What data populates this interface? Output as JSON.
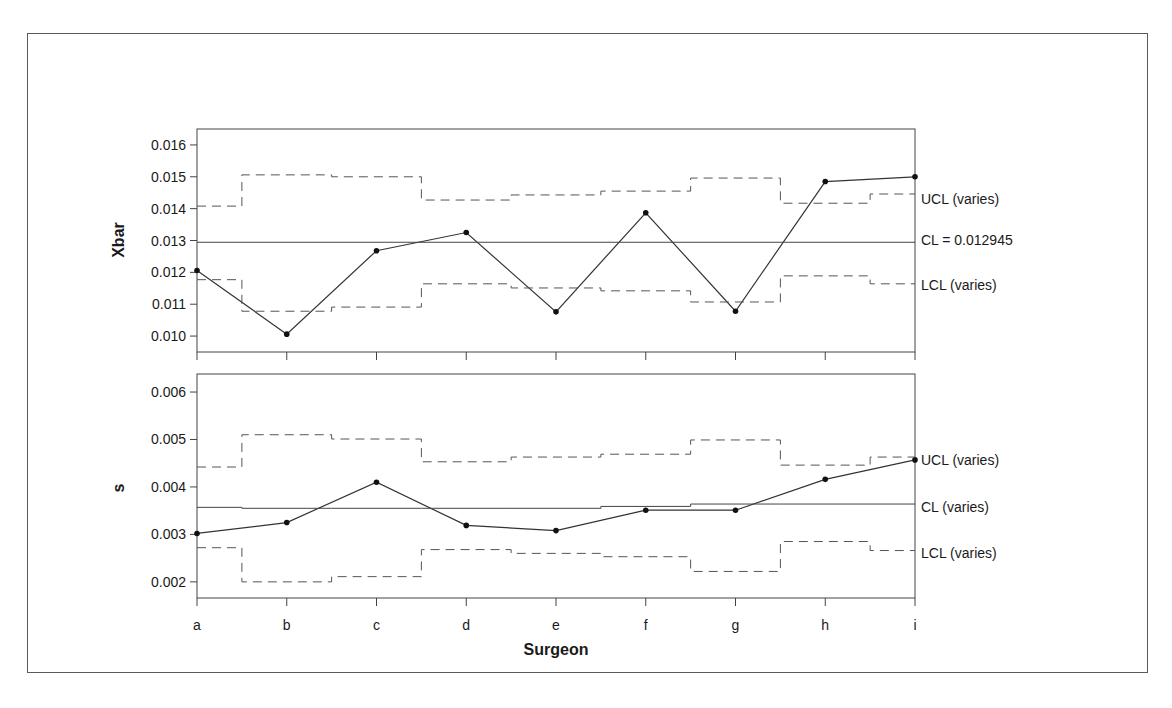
{
  "chart_data": [
    {
      "type": "line",
      "subtype": "xbar-control-chart",
      "panel": "top",
      "ylabel": "Xbar",
      "xlabel": "Surgeon",
      "categories": [
        "a",
        "b",
        "c",
        "d",
        "e",
        "f",
        "g",
        "h",
        "i"
      ],
      "ylim": [
        0.0095,
        0.0165
      ],
      "yticks": [
        "0.010",
        "0.011",
        "0.012",
        "0.013",
        "0.014",
        "0.015",
        "0.016"
      ],
      "series": [
        {
          "name": "Xbar",
          "values": [
            0.01206,
            0.01006,
            0.01268,
            0.01325,
            0.01076,
            0.01387,
            0.01078,
            0.01485,
            0.015
          ]
        },
        {
          "name": "UCL",
          "style": "dashed-step",
          "values": [
            0.01408,
            0.01506,
            0.015,
            0.01427,
            0.01443,
            0.01455,
            0.01496,
            0.01417,
            0.01446
          ]
        },
        {
          "name": "CL",
          "style": "solid",
          "values": [
            0.012945,
            0.012945,
            0.012945,
            0.012945,
            0.012945,
            0.012945,
            0.012945,
            0.012945,
            0.012945
          ]
        },
        {
          "name": "LCL",
          "style": "dashed-step",
          "values": [
            0.01177,
            0.01078,
            0.01091,
            0.01164,
            0.01151,
            0.01142,
            0.01107,
            0.01189,
            0.01164
          ]
        }
      ],
      "annotations": {
        "ucl": "UCL (varies)",
        "cl": "CL = 0.012945",
        "lcl": "LCL (varies)"
      }
    },
    {
      "type": "line",
      "subtype": "s-control-chart",
      "panel": "bottom",
      "ylabel": "s",
      "xlabel": "Surgeon",
      "categories": [
        "a",
        "b",
        "c",
        "d",
        "e",
        "f",
        "g",
        "h",
        "i"
      ],
      "ylim": [
        0.00166,
        0.00638
      ],
      "yticks": [
        "0.002",
        "0.003",
        "0.004",
        "0.005",
        "0.006"
      ],
      "series": [
        {
          "name": "s",
          "values": [
            0.00302,
            0.00325,
            0.0041,
            0.00319,
            0.00308,
            0.00351,
            0.00351,
            0.00416,
            0.00457
          ]
        },
        {
          "name": "UCL",
          "style": "dashed-step",
          "values": [
            0.00442,
            0.0051,
            0.00501,
            0.00453,
            0.00463,
            0.00469,
            0.00499,
            0.00446,
            0.00463
          ]
        },
        {
          "name": "CL",
          "style": "solid-step",
          "values": [
            0.00357,
            0.00355,
            0.00355,
            0.00355,
            0.00355,
            0.00359,
            0.00364,
            0.00364,
            0.00364
          ]
        },
        {
          "name": "LCL",
          "style": "dashed-step",
          "values": [
            0.00272,
            0.002,
            0.00211,
            0.00268,
            0.0026,
            0.00253,
            0.00222,
            0.00285,
            0.00266
          ]
        }
      ],
      "annotations": {
        "ucl": "UCL (varies)",
        "cl": "CL (varies)",
        "lcl": "LCL (varies)"
      }
    }
  ],
  "labels": {
    "top_ylabel": "Xbar",
    "bottom_ylabel": "s",
    "xlabel": "Surgeon",
    "top_ucl": "UCL (varies)",
    "top_cl": "CL = 0.012945",
    "top_lcl": "LCL (varies)",
    "bottom_ucl": "UCL (varies)",
    "bottom_cl": "CL (varies)",
    "bottom_lcl": "LCL (varies)"
  }
}
